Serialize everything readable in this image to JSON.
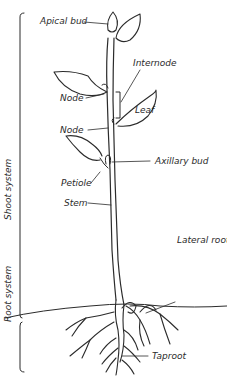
{
  "diagram": {
    "colors": {
      "ink": "#2b2b2b",
      "background": "#ffffff"
    },
    "systems": [
      {
        "id": "shoot",
        "label": "Shoot system"
      },
      {
        "id": "root",
        "label": "Root system"
      }
    ],
    "labels": {
      "apical_bud": "Apical bud",
      "internode": "Internode",
      "node_upper": "Node",
      "leaf": "Leaf",
      "node_lower": "Node",
      "axillary_bud": "Axillary bud",
      "petiole": "Petiole",
      "stem": "Stem",
      "lateral_root": "Lateral root",
      "taproot": "Taproot"
    }
  }
}
